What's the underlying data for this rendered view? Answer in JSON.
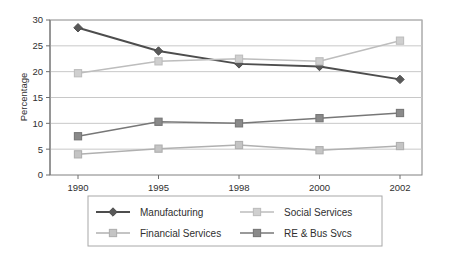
{
  "chart_data": {
    "type": "line",
    "title": "",
    "xlabel": "",
    "ylabel": "Percentage",
    "categories": [
      "1990",
      "1995",
      "1998",
      "2000",
      "2002"
    ],
    "ylim": [
      0,
      30
    ],
    "yticks": [
      0,
      5,
      10,
      15,
      20,
      25,
      30
    ],
    "ytick_labels": [
      "0",
      "5",
      "10",
      "15",
      "20",
      "25",
      "30"
    ],
    "grid": "horizontal",
    "legend_position": "bottom",
    "series": [
      {
        "name": "Manufacturing",
        "values": [
          28.5,
          24.0,
          21.5,
          21.0,
          18.5
        ],
        "color": "#4d4d4d",
        "marker": "diamond",
        "marker_fill": "#595959"
      },
      {
        "name": "Social Services",
        "values": [
          19.7,
          22.0,
          22.5,
          22.0,
          26.0
        ],
        "color": "#bdbdbd",
        "marker": "square",
        "marker_fill": "#cfcfcf"
      },
      {
        "name": "Financial Services",
        "values": [
          4.0,
          5.1,
          5.8,
          4.8,
          5.6
        ],
        "color": "#b0b0b0",
        "marker": "square",
        "marker_fill": "#c4c4c4"
      },
      {
        "name": "RE & Bus Svcs",
        "values": [
          7.5,
          10.3,
          10.0,
          11.0,
          12.0
        ],
        "color": "#777777",
        "marker": "square",
        "marker_fill": "#8a8a8a"
      }
    ]
  },
  "axis": {
    "y_title": "Percentage",
    "y_labels": [
      "30",
      "25",
      "20",
      "15",
      "10",
      "5",
      "0"
    ],
    "x_labels": [
      "1990",
      "1995",
      "1998",
      "2000",
      "2002"
    ]
  },
  "legend": {
    "entries": [
      {
        "label": "Manufacturing"
      },
      {
        "label": "Social Services"
      },
      {
        "label": "Financial Services"
      },
      {
        "label": "RE & Bus Svcs"
      }
    ]
  },
  "colors": {
    "background": "#ffffff",
    "frame": "#808080",
    "gridline": "#c8c8c8",
    "text": "#2f2f2f",
    "legend_border": "#a8a8a8"
  }
}
